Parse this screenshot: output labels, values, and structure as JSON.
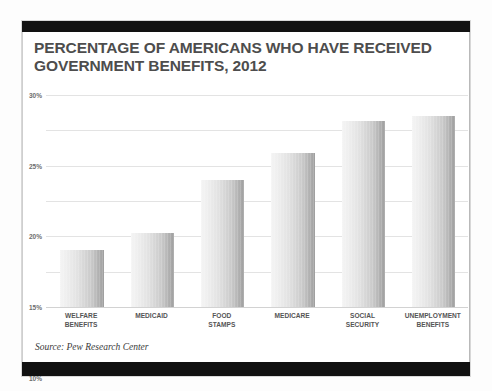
{
  "card": {
    "title_line1": "PERCENTAGE OF AMERICANS WHO HAVE RECEIVED",
    "title_line2": "GOVERNMENT BENEFITS, 2012",
    "source_note": "Source: Pew Research Center"
  },
  "chart_data": {
    "type": "bar",
    "title": "PERCENTAGE OF AMERICANS WHO HAVE RECEIVED GOVERNMENT BENEFITS, 2012",
    "xlabel": "",
    "ylabel": "",
    "ylim": [
      0,
      30
    ],
    "ytick_step": 5,
    "ytick_labels": [
      "0%",
      "5%",
      "10%",
      "15%",
      "20%",
      "25%",
      "30%"
    ],
    "ytick_values": [
      0,
      5,
      10,
      15,
      20,
      25,
      30
    ],
    "grid": true,
    "legend": "none",
    "value_suffix": "%",
    "categories": [
      "WELFARE BENEFITS",
      "MEDICAID",
      "FOOD STAMPS",
      "MEDICARE",
      "SOCIAL SECURITY",
      "UNEMPLOYMENT BENEFITS"
    ],
    "category_lines": [
      [
        "WELFARE",
        "BENEFITS"
      ],
      [
        "MEDICAID"
      ],
      [
        "FOOD",
        "STAMPS"
      ],
      [
        "MEDICARE"
      ],
      [
        "SOCIAL",
        "SECURITY"
      ],
      [
        "UNEMPLOYMENT",
        "BENEFITS"
      ]
    ],
    "values": [
      8.0,
      10.5,
      18.0,
      21.8,
      26.3,
      27.0
    ],
    "bar_color": "#c9c9c9",
    "grid_color": "#e3e3e3",
    "title_color": "#4d4d4d",
    "axis_text_color": "#6d6d6d"
  }
}
